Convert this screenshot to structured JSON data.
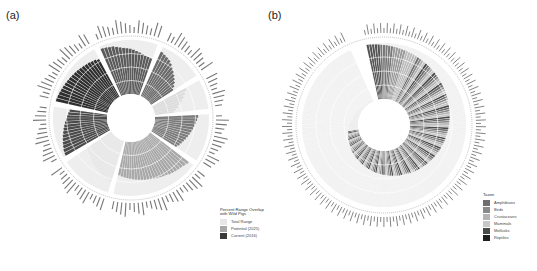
{
  "panels": {
    "a": {
      "label": "(a)"
    },
    "b": {
      "label": "(b)"
    }
  },
  "legend_a": {
    "title_line1": "Percent Range Overlap",
    "title_line2": "with Wild Pigs",
    "items": [
      {
        "label": "Total Range",
        "color": "#e6e6e6"
      },
      {
        "label": "Potential (2025)",
        "color": "#a8a8a8"
      },
      {
        "label": "Current (2016)",
        "color": "#3a3a3a"
      }
    ]
  },
  "legend_b": {
    "title": "Taxon",
    "items": [
      {
        "label": "Amphibians",
        "color": "#6e6e6e"
      },
      {
        "label": "Birds",
        "color": "#8a8a8a"
      },
      {
        "label": "Crustaceans",
        "color": "#b4b4b4"
      },
      {
        "label": "Mammals",
        "color": "#c8c8c8"
      },
      {
        "label": "Mollusks",
        "color": "#4a4a4a"
      },
      {
        "label": "Reptiles",
        "color": "#1e1e1e"
      }
    ]
  },
  "chart_data": [
    {
      "type": "bar",
      "subtype": "circular",
      "title": "(a)",
      "radial_ticks": [
        "25%",
        "50%",
        "75%"
      ],
      "ylim": [
        0,
        100
      ],
      "groups": [
        {
          "name": "Amphibians",
          "color": "#5a5a5a",
          "n": 16,
          "values": [
            95,
            94,
            93,
            92,
            90,
            88,
            86,
            85,
            84,
            82,
            80,
            78,
            76,
            74,
            73,
            72
          ]
        },
        {
          "name": "Birds",
          "color": "#6a6a6a",
          "n": 12,
          "values": [
            90,
            88,
            86,
            84,
            80,
            76,
            72,
            68,
            64,
            60,
            55,
            50
          ]
        },
        {
          "name": "Crustaceans",
          "color": "#dcdcdc",
          "n": 8,
          "values": [
            70,
            65,
            60,
            55,
            50,
            45,
            40,
            35
          ]
        },
        {
          "name": "Fishes",
          "color": "#7a7a7a",
          "n": 13,
          "values": [
            80,
            78,
            76,
            74,
            72,
            70,
            68,
            66,
            64,
            62,
            60,
            58,
            55
          ]
        },
        {
          "name": "Mammals",
          "color": "#a8a8a8",
          "n": 24,
          "values": [
            90,
            88,
            86,
            85,
            84,
            83,
            82,
            80,
            79,
            78,
            77,
            76,
            75,
            74,
            73,
            72,
            71,
            70,
            69,
            68,
            67,
            66,
            65,
            64
          ]
        },
        {
          "name": "Mollusks",
          "color": "#e8e8e8",
          "n": 14,
          "values": [
            80,
            78,
            76,
            74,
            72,
            70,
            68,
            66,
            64,
            62,
            60,
            58,
            56,
            54
          ]
        },
        {
          "name": "Plants",
          "color": "#4a4a4a",
          "n": 14,
          "values": [
            95,
            94,
            92,
            90,
            88,
            86,
            84,
            82,
            80,
            78,
            76,
            74,
            72,
            70
          ]
        },
        {
          "name": "Reptiles",
          "color": "#2e2e2e",
          "n": 18,
          "values": [
            98,
            97,
            96,
            95,
            94,
            93,
            92,
            91,
            90,
            89,
            88,
            87,
            86,
            85,
            84,
            83,
            82,
            80
          ]
        }
      ]
    },
    {
      "type": "bar",
      "subtype": "circular",
      "title": "(b)",
      "radial_ticks": [
        "25%",
        "50%",
        "75%"
      ],
      "ylim": [
        0,
        100
      ],
      "n_bars": 180,
      "legend": "bottom-right",
      "note": "bars sorted by value, descending clockwise from top; shaded by taxon"
    }
  ]
}
